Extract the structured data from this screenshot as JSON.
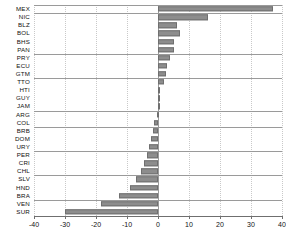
{
  "chart_data": {
    "type": "bar",
    "orientation": "horizontal",
    "title": "",
    "subtitle": "",
    "xlabel": "",
    "ylabel": "",
    "xlim": [
      -40,
      40
    ],
    "xticks": [
      -40,
      -30,
      -20,
      -10,
      0,
      10,
      20,
      30,
      40
    ],
    "xtick_labels": [
      "-40",
      "-30",
      "-20",
      "-10",
      "0",
      "10",
      "20",
      "30",
      "40"
    ],
    "grid": true,
    "legend": "none",
    "bar_color": "#8d8d8d",
    "bar_edge_color": "#6f6f6f",
    "zero_line_color": "#9a9a9a",
    "separator_color": "#9a9a9a",
    "categories": [
      "MEX",
      "NIC",
      "BLZ",
      "BOL",
      "BHS",
      "PAN",
      "PRY",
      "ECU",
      "GTM",
      "TTO",
      "HTI",
      "GUY",
      "JAM",
      "ARG",
      "COL",
      "BRB",
      "DOM",
      "URY",
      "PER",
      "CRI",
      "CHL",
      "SLV",
      "HND",
      "BRA",
      "VEN",
      "SUR"
    ],
    "values": [
      37.0,
      16.0,
      6.0,
      7.0,
      5.0,
      5.0,
      4.0,
      3.0,
      2.5,
      2.0,
      0.6,
      0.4,
      0.3,
      -0.4,
      -1.2,
      -1.6,
      -2.2,
      -2.8,
      -3.4,
      -4.4,
      -5.6,
      -7.0,
      -9.0,
      -12.5,
      -18.5,
      -30.0
    ],
    "separators_after": [
      "MEX",
      "PAN",
      "GTM",
      "JAM",
      "COL",
      "URY",
      "CHL",
      "BRA",
      "SUR"
    ]
  }
}
